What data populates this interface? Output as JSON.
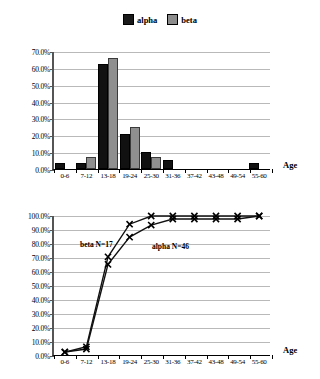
{
  "legend": {
    "items": [
      {
        "label": "alpha",
        "color": "#111111",
        "icon": "legend-swatch-square"
      },
      {
        "label": "beta",
        "color": "#8f8f8f",
        "icon": "legend-swatch-square"
      }
    ]
  },
  "axis_title": "Age",
  "categories": [
    "0-6",
    "7-12",
    "13-18",
    "19-24",
    "25-30",
    "31-36",
    "37-42",
    "43-48",
    "49-54",
    "55-60"
  ],
  "bar_yticks": [
    "0.0%",
    "10.0%",
    "20.0%",
    "30.0%",
    "40.0%",
    "50.0%",
    "60.0%",
    "70.0%"
  ],
  "line_yticks": [
    "0.0%",
    "10.0%",
    "20.0%",
    "30.0%",
    "40.0%",
    "50.0%",
    "60.0%",
    "70.0%",
    "80.0%",
    "90.0%",
    "100.0%"
  ],
  "line_annotations": [
    {
      "text": "beta N=17"
    },
    {
      "text": "alpha N=46"
    }
  ],
  "chart_data": [
    {
      "type": "bar",
      "title": "",
      "xlabel": "Age",
      "ylabel": "",
      "ylim": [
        0,
        70
      ],
      "ytick_step": 10,
      "grid": true,
      "legend_position": "top-center",
      "categories": [
        "0-6",
        "7-12",
        "13-18",
        "19-24",
        "25-30",
        "31-36",
        "37-42",
        "43-48",
        "49-54",
        "55-60"
      ],
      "series": [
        {
          "name": "alpha",
          "color": "#111111",
          "values": [
            2.2,
            2.2,
            60.9,
            19.6,
            8.7,
            4.3,
            0,
            0,
            0,
            2.2
          ]
        },
        {
          "name": "beta",
          "color": "#8f8f8f",
          "values": [
            0,
            5.9,
            64.7,
            23.5,
            5.9,
            0,
            0,
            0,
            0,
            0
          ]
        }
      ]
    },
    {
      "type": "line",
      "title": "",
      "xlabel": "Age",
      "ylabel": "",
      "ylim": [
        0,
        100
      ],
      "ytick_step": 10,
      "grid": true,
      "marker": "x",
      "categories": [
        "0-6",
        "7-12",
        "13-18",
        "19-24",
        "25-30",
        "31-36",
        "37-42",
        "43-48",
        "49-54",
        "55-60"
      ],
      "series": [
        {
          "name": "alpha N=46",
          "color": "#111111",
          "values": [
            2.2,
            4.3,
            65.2,
            84.8,
            93.5,
            97.8,
            97.8,
            97.8,
            97.8,
            100.0
          ]
        },
        {
          "name": "beta N=17",
          "color": "#111111",
          "values": [
            2.0,
            5.9,
            70.6,
            94.1,
            100.0,
            100.0,
            100.0,
            100.0,
            100.0,
            100.0
          ]
        }
      ],
      "annotations": [
        "beta N=17",
        "alpha N=46"
      ]
    }
  ]
}
